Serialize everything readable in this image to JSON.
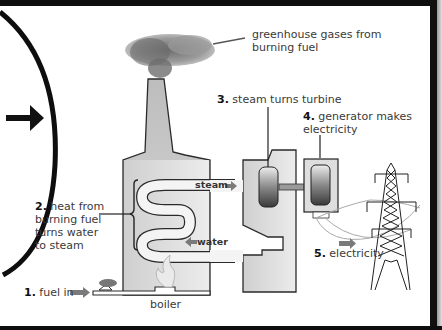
{
  "diagram": {
    "labels": {
      "greenhouse": {
        "line1": "greenhouse gases from",
        "line2": "burning fuel"
      },
      "step1": {
        "num": "1.",
        "text": "fuel in"
      },
      "step2": {
        "num": "2.",
        "line1": "heat from",
        "line2": "burning fuel",
        "line3": "turns water",
        "line4": "to steam"
      },
      "step3": {
        "num": "3.",
        "text": "steam turns turbine"
      },
      "step4": {
        "num": "4.",
        "line1": "generator makes",
        "line2": "electricity"
      },
      "step5": {
        "num": "5.",
        "text": "electricity"
      },
      "boiler": "boiler",
      "steam": "steam",
      "water": "water"
    },
    "icons": [
      "right-arrow-icon",
      "smoke-cloud-icon",
      "flame-icon",
      "fuel-pile-icon",
      "turbine-icon",
      "generator-icon",
      "transmission-tower-icon"
    ],
    "colors": {
      "frame": "#0e0e0e",
      "building_fill": "#dcdcdc",
      "outline": "#2a2a2a",
      "flow_arrow": "#7a7a7a",
      "text": "#3a3a3a"
    }
  }
}
